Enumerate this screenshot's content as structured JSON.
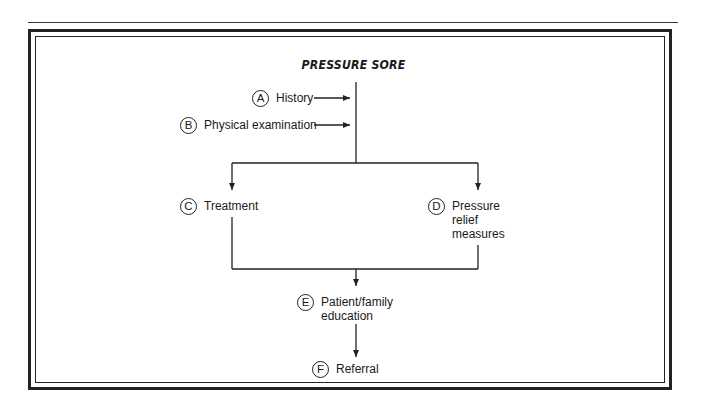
{
  "title": "PRESSURE SORE",
  "nodes": {
    "a": {
      "badge": "A",
      "label": "History"
    },
    "b": {
      "badge": "B",
      "label": "Physical examination"
    },
    "c": {
      "badge": "C",
      "label": "Treatment"
    },
    "d": {
      "badge": "D",
      "label": "Pressure\nrelief\nmeasures"
    },
    "e": {
      "badge": "E",
      "label": "Patient/family\neducation"
    },
    "f": {
      "badge": "F",
      "label": "Referral"
    }
  },
  "colors": {
    "line": "#222222",
    "background": "#ffffff"
  }
}
